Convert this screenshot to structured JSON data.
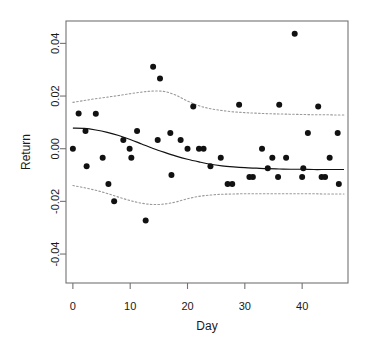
{
  "chart_data": {
    "type": "scatter",
    "title": "",
    "xlabel": "Day",
    "ylabel": "Return",
    "xlim": [
      -1.2,
      48.0
    ],
    "ylim": [
      -0.051,
      0.0485
    ],
    "xticks": [
      0,
      10,
      20,
      30,
      40
    ],
    "xtick_labels": [
      "0",
      "10",
      "20",
      "30",
      "40"
    ],
    "yticks": [
      0.04,
      0.02,
      0.0,
      -0.02,
      -0.04
    ],
    "ytick_labels": [
      "0.04",
      "0.02",
      "0.00",
      "-0.02",
      "-0.04"
    ],
    "grid": false,
    "legend": null,
    "legend_position": "none",
    "point_color": "#111111",
    "fit_color": "#111111",
    "band_color": "#9a9a9a",
    "axis_color": "#737373",
    "series": [
      {
        "name": "Return observations",
        "marker": "filled-circle",
        "points": [
          [
            0.0,
            0.0
          ],
          [
            1.0,
            0.0134
          ],
          [
            2.2,
            0.0067
          ],
          [
            2.4,
            -0.0067
          ],
          [
            4.0,
            0.0133
          ],
          [
            5.2,
            -0.0034
          ],
          [
            6.2,
            -0.0134
          ],
          [
            7.2,
            -0.02
          ],
          [
            8.8,
            0.0033
          ],
          [
            9.9,
            0.0
          ],
          [
            10.2,
            -0.0034
          ],
          [
            11.2,
            0.0067
          ],
          [
            12.7,
            -0.0273
          ],
          [
            14.0,
            0.0311
          ],
          [
            14.8,
            0.0033
          ],
          [
            15.2,
            0.0267
          ],
          [
            17.0,
            0.006
          ],
          [
            17.2,
            -0.01
          ],
          [
            18.8,
            0.0033
          ],
          [
            20.0,
            0.0
          ],
          [
            21.0,
            0.016
          ],
          [
            22.0,
            0.0
          ],
          [
            22.8,
            0.0
          ],
          [
            24.0,
            -0.0067
          ],
          [
            25.8,
            -0.0034
          ],
          [
            27.0,
            -0.0134
          ],
          [
            27.8,
            -0.0134
          ],
          [
            29.0,
            0.0167
          ],
          [
            30.8,
            -0.0107
          ],
          [
            31.4,
            -0.0107
          ],
          [
            33.0,
            0.0
          ],
          [
            34.0,
            -0.0074
          ],
          [
            34.8,
            -0.0034
          ],
          [
            35.8,
            -0.0107
          ],
          [
            36.0,
            0.0167
          ],
          [
            37.2,
            -0.0034
          ],
          [
            38.7,
            0.0437
          ],
          [
            40.0,
            -0.0107
          ],
          [
            40.2,
            -0.0074
          ],
          [
            41.0,
            0.006
          ],
          [
            42.8,
            0.016
          ],
          [
            43.4,
            -0.0107
          ],
          [
            44.0,
            -0.0107
          ],
          [
            44.8,
            -0.0034
          ],
          [
            46.2,
            0.006
          ],
          [
            46.4,
            -0.0134
          ]
        ]
      }
    ],
    "fit_curve": {
      "name": "Loess smooth",
      "style": "solid",
      "points": [
        [
          0.0,
          0.0078
        ],
        [
          2.0,
          0.0077
        ],
        [
          4.0,
          0.0071
        ],
        [
          6.0,
          0.0062
        ],
        [
          8.0,
          0.005
        ],
        [
          10.0,
          0.0035
        ],
        [
          12.0,
          0.0018
        ],
        [
          14.0,
          0.0001
        ],
        [
          16.0,
          -0.0014
        ],
        [
          18.0,
          -0.0028
        ],
        [
          20.0,
          -0.004
        ],
        [
          22.0,
          -0.005
        ],
        [
          24.0,
          -0.0059
        ],
        [
          26.0,
          -0.0065
        ],
        [
          28.0,
          -0.0069
        ],
        [
          30.0,
          -0.0072
        ],
        [
          32.0,
          -0.0074
        ],
        [
          34.0,
          -0.0076
        ],
        [
          36.0,
          -0.0077
        ],
        [
          38.0,
          -0.0078
        ],
        [
          40.0,
          -0.0078
        ],
        [
          42.0,
          -0.0079
        ],
        [
          44.0,
          -0.0079
        ],
        [
          46.0,
          -0.0079
        ],
        [
          47.3,
          -0.0079
        ]
      ]
    },
    "upper_band": {
      "name": "Upper confidence band",
      "style": "dotted",
      "points": [
        [
          0.0,
          0.0176
        ],
        [
          2.0,
          0.0183
        ],
        [
          4.0,
          0.019
        ],
        [
          6.0,
          0.0196
        ],
        [
          8.0,
          0.0202
        ],
        [
          10.0,
          0.0209
        ],
        [
          12.0,
          0.0215
        ],
        [
          14.0,
          0.0219
        ],
        [
          16.0,
          0.0217
        ],
        [
          18.0,
          0.0203
        ],
        [
          20.0,
          0.0181
        ],
        [
          22.0,
          0.0163
        ],
        [
          24.0,
          0.0152
        ],
        [
          26.0,
          0.0145
        ],
        [
          28.0,
          0.014
        ],
        [
          30.0,
          0.0137
        ],
        [
          32.0,
          0.0135
        ],
        [
          34.0,
          0.0133
        ],
        [
          36.0,
          0.0132
        ],
        [
          38.0,
          0.0131
        ],
        [
          40.0,
          0.013
        ],
        [
          42.0,
          0.0129
        ],
        [
          44.0,
          0.0129
        ],
        [
          46.0,
          0.0128
        ],
        [
          47.3,
          0.0128
        ]
      ]
    },
    "lower_band": {
      "name": "Lower confidence band",
      "style": "dotted",
      "points": [
        [
          0.0,
          -0.014
        ],
        [
          2.0,
          -0.0148
        ],
        [
          4.0,
          -0.0158
        ],
        [
          6.0,
          -0.017
        ],
        [
          8.0,
          -0.0184
        ],
        [
          10.0,
          -0.0197
        ],
        [
          12.0,
          -0.0207
        ],
        [
          14.0,
          -0.0212
        ],
        [
          16.0,
          -0.021
        ],
        [
          18.0,
          -0.0202
        ],
        [
          20.0,
          -0.019
        ],
        [
          22.0,
          -0.0181
        ],
        [
          24.0,
          -0.0176
        ],
        [
          26.0,
          -0.0173
        ],
        [
          28.0,
          -0.0172
        ],
        [
          30.0,
          -0.0171
        ],
        [
          32.0,
          -0.0171
        ],
        [
          34.0,
          -0.0171
        ],
        [
          36.0,
          -0.0171
        ],
        [
          38.0,
          -0.0171
        ],
        [
          40.0,
          -0.0171
        ],
        [
          42.0,
          -0.0171
        ],
        [
          44.0,
          -0.0172
        ],
        [
          46.0,
          -0.0172
        ],
        [
          47.3,
          -0.0172
        ]
      ]
    }
  }
}
